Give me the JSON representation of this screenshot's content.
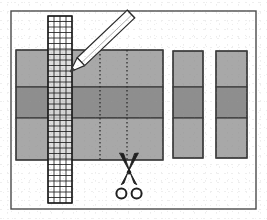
{
  "figure": {
    "caption": "",
    "width": 267,
    "height": 220,
    "background_color": "#ffffff"
  },
  "frame": {
    "name": "outer-border",
    "x": 11,
    "y": 11,
    "width": 245,
    "height": 198,
    "stroke_color": "#4a4a4a",
    "stroke_width": 1.4,
    "fill_color": "#ffffff"
  },
  "main_sheet": {
    "label": "main banded sheet",
    "x": 16,
    "y": 50,
    "width": 147,
    "height": 110,
    "stroke_color": "#3a3a3a",
    "stroke_width": 1.2,
    "bands": [
      {
        "label": "top band",
        "y": 50,
        "height": 37,
        "fill_color": "#a8a8a8"
      },
      {
        "label": "middle band",
        "y": 87,
        "height": 31,
        "fill_color": "#8e8e8e"
      },
      {
        "label": "bottom band",
        "y": 118,
        "height": 42,
        "fill_color": "#a8a8a8"
      }
    ]
  },
  "cut_lines": [
    {
      "label": "first cut line",
      "x": 100,
      "y1": 50,
      "y2": 160,
      "style": "dotted",
      "color": "#2b2b2b"
    },
    {
      "label": "second cut line",
      "x": 127,
      "y1": 50,
      "y2": 160,
      "style": "dotted",
      "color": "#2b2b2b"
    }
  ],
  "grid_strip": {
    "label": "graph paper measuring strip",
    "x": 48,
    "y": 16,
    "width": 24,
    "height": 187,
    "columns": 4,
    "rows": 34,
    "cell_width": 6,
    "cell_height": 5.5,
    "line_color": "#1e1e1e",
    "line_width": 0.9,
    "fill_color": "#ffffff",
    "outline_color": "#1a1a1a"
  },
  "pencil": {
    "label": "pencil",
    "tip_x": 70,
    "tip_y": 72,
    "end_x": 131,
    "end_y": 14,
    "body_color": "#ffffff",
    "outline_color": "#2a2a2a",
    "tip_color": "#3a3a3a",
    "shading_color": "#cfcfcf"
  },
  "scissors": {
    "label": "scissors",
    "x": 113,
    "y": 152,
    "width": 32,
    "height": 48,
    "blade_color": "#1f1f1f",
    "handle_color": "#1f1f1f",
    "handle_fill": "#ffffff"
  },
  "cut_pieces": [
    {
      "label": "cut piece one",
      "x": 173,
      "y": 51,
      "width": 30,
      "height": 107,
      "stroke_color": "#3a3a3a",
      "bands": [
        {
          "label": "top band",
          "y": 51,
          "height": 36,
          "fill_color": "#a8a8a8"
        },
        {
          "label": "middle band",
          "y": 87,
          "height": 31,
          "fill_color": "#8e8e8e"
        },
        {
          "label": "bottom band",
          "y": 118,
          "height": 40,
          "fill_color": "#a8a8a8"
        }
      ]
    },
    {
      "label": "cut piece two",
      "x": 216,
      "y": 51,
      "width": 31,
      "height": 107,
      "stroke_color": "#3a3a3a",
      "bands": [
        {
          "label": "top band",
          "y": 51,
          "height": 36,
          "fill_color": "#a8a8a8"
        },
        {
          "label": "middle band",
          "y": 87,
          "height": 31,
          "fill_color": "#8e8e8e"
        },
        {
          "label": "bottom band",
          "y": 118,
          "height": 40,
          "fill_color": "#a8a8a8"
        }
      ]
    }
  ],
  "palette": {
    "light_gray": "#a8a8a8",
    "dark_gray": "#8e8e8e",
    "outline": "#3a3a3a",
    "frame": "#4a4a4a",
    "ink": "#1f1f1f",
    "paper": "#ffffff"
  }
}
